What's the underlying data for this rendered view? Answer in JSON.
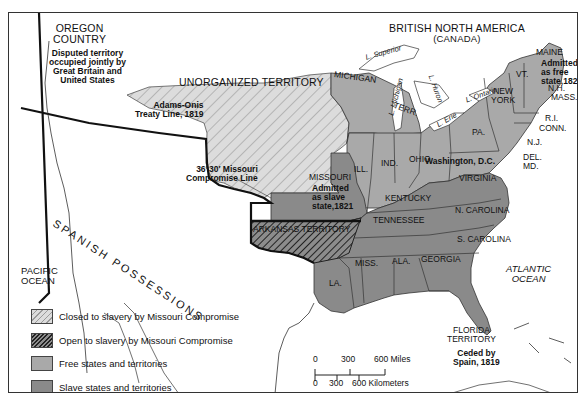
{
  "map": {
    "regions": {
      "oregon": {
        "title_line1": "OREGON",
        "title_line2": "COUNTRY",
        "note_line1": "Disputed territory",
        "note_line2": "occupied jointly by",
        "note_line3": "Great Britain and",
        "note_line4": "United States"
      },
      "british": {
        "line1": "BRITISH NORTH AMERICA",
        "line2": "(CANADA)"
      },
      "unorganized": "UNORGANIZED TERRITORY",
      "spanish": "SPANISH POSSESSIONS",
      "arkansas": "ARKANSAS TERRITORY",
      "michigan_terr_line1": "MICHIGAN",
      "michigan_terr_line2": "TERR.",
      "florida": {
        "line1": "FLORIDA",
        "line2": "TERRITORY",
        "note1": "Ceded by",
        "note2": "Spain, 1819"
      },
      "missouri": {
        "name": "MISSOURI",
        "note1": "Admitted",
        "note2": "as slave",
        "note3": "state,1821"
      },
      "maine": {
        "name": "MAINE",
        "note1": "Admitted",
        "note2": "as free",
        "note3": "state,1820"
      }
    },
    "states": {
      "ill": "ILL.",
      "ind": "IND.",
      "ohio": "OHIO",
      "pa": "PA.",
      "new_york_1": "NEW",
      "new_york_2": "YORK",
      "vt": "VT.",
      "nh": "N.H.",
      "mass": "MASS.",
      "ri": "R.I.",
      "conn": "CONN.",
      "nj": "N.J.",
      "del": "DEL.",
      "md": "MD.",
      "virginia": "VIRGINIA",
      "kentucky": "KENTUCKY",
      "tennessee": "TENNESSEE",
      "n_carolina": "N. CAROLINA",
      "s_carolina": "S. CAROLINA",
      "georgia": "GEORGIA",
      "ala": "ALA.",
      "miss": "MISS.",
      "la": "LA."
    },
    "places": {
      "washington": "Washington, D.C."
    },
    "lakes": {
      "superior": "L. Superior",
      "michigan": "L. Michigan",
      "huron": "L. Huron",
      "erie": "L. Erie",
      "ontario": "L. Ontario"
    },
    "oceans": {
      "pacific_1": "PACIFIC",
      "pacific_2": "OCEAN",
      "atlantic_1": "ATLANTIC",
      "atlantic_2": "OCEAN"
    },
    "lines": {
      "adams_onis_1": "Adams-Onis",
      "adams_onis_2": "Treaty Line, 1819",
      "missouri_comp_1": "36°30′ Missouri",
      "missouri_comp_2": "Compromise Line"
    }
  },
  "legend": [
    {
      "label": "Closed to slavery by Missouri Compromise",
      "pattern": "closed"
    },
    {
      "label": "Open to slavery by Missouri Compromise",
      "pattern": "open"
    },
    {
      "label": "Free states and territories",
      "pattern": "free"
    },
    {
      "label": "Slave states and territories",
      "pattern": "slave"
    }
  ],
  "scale": {
    "miles_ticks": [
      "0",
      "300",
      "600 Miles"
    ],
    "km_ticks": [
      "0",
      "300",
      "600 Kilometers"
    ]
  },
  "colors": {
    "closed_fill": "#d9d9d9",
    "open_fill": "#7a7a7a",
    "free_fill": "#a9a9a9",
    "slave_fill": "#8a8a8a",
    "border": "#222222"
  }
}
